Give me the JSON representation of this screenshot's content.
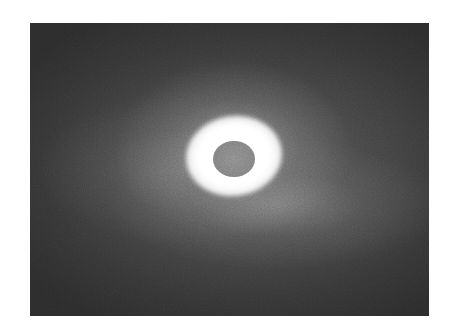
{
  "image": {
    "subject": "total solar eclipse",
    "style": "grayscale photograph",
    "colors": {
      "background_page": "#ffffff",
      "sky": "#3a3a3a",
      "corona": "#ffffff",
      "moon_disc": "#808080"
    }
  }
}
